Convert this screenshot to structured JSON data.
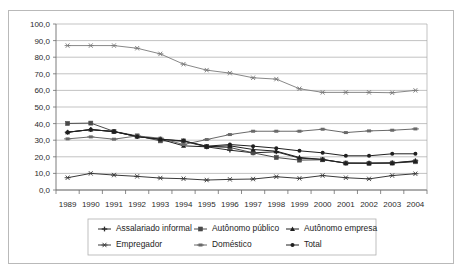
{
  "page": {
    "top_fragment": ""
  },
  "chart_data": {
    "type": "line",
    "title": "",
    "subtitle": "",
    "xlabel": "",
    "ylabel": "",
    "grid": true,
    "legend_position": "bottom",
    "ylim": [
      0,
      100
    ],
    "ytick_labels": [
      "0,0",
      "10,0",
      "20,0",
      "30,0",
      "40,0",
      "50,0",
      "60,0",
      "70,0",
      "80,0",
      "90,0",
      "100,0"
    ],
    "ytick_values": [
      0,
      10,
      20,
      30,
      40,
      50,
      60,
      70,
      80,
      90,
      100
    ],
    "categories": [
      "1989",
      "1990",
      "1991",
      "1992",
      "1993",
      "1994",
      "1995",
      "1996",
      "1997",
      "1998",
      "1999",
      "2000",
      "2001",
      "2002",
      "2003",
      "2004"
    ],
    "series": [
      {
        "name": "Assalariado informal",
        "marker": "cross-plus",
        "color": "#2a2a2a",
        "values": [
          34.8,
          36.4,
          35.2,
          32.2,
          30.6,
          29.4,
          26.0,
          24.0,
          22.4,
          23.0,
          19.2,
          18.4,
          16.2,
          16.2,
          16.3,
          17.6
        ]
      },
      {
        "name": "Autônomo público",
        "marker": "square",
        "color": "#4a4a4a",
        "values": [
          40.1,
          40.3,
          35.3,
          32.6,
          29.6,
          29.6,
          26.2,
          25.6,
          22.4,
          19.6,
          18.0,
          18.2,
          16.2,
          16.0,
          16.2,
          17.0
        ]
      },
      {
        "name": "Autônomo empresa",
        "marker": "triangle",
        "color": "#1f1f1f",
        "values": [
          34.8,
          36.4,
          35.2,
          32.2,
          30.6,
          26.6,
          26.0,
          26.6,
          24.4,
          23.4,
          19.6,
          18.4,
          16.2,
          16.2,
          16.3,
          17.4
        ]
      },
      {
        "name": "Empregador",
        "marker": "star",
        "color": "#3a3a3a",
        "values": [
          7.4,
          10.0,
          9.0,
          8.2,
          7.2,
          6.8,
          6.0,
          6.4,
          6.6,
          8.0,
          7.0,
          8.7,
          7.4,
          6.7,
          8.7,
          9.8
        ]
      },
      {
        "name": "Doméstico",
        "marker": "dash-square",
        "color": "#6a6a6a",
        "values": [
          30.8,
          32.0,
          30.6,
          32.6,
          31.2,
          27.4,
          30.4,
          33.4,
          35.4,
          35.4,
          35.4,
          36.6,
          34.6,
          35.6,
          36.0,
          36.8
        ]
      },
      {
        "name": "Total",
        "marker": "circle",
        "color": "#202020",
        "values": [
          34.8,
          36.4,
          35.2,
          32.2,
          30.6,
          29.6,
          26.4,
          27.4,
          26.4,
          25.2,
          23.6,
          22.4,
          20.6,
          20.6,
          21.8,
          21.8
        ]
      }
    ],
    "top_series_note": {
      "name": "Autônomo público",
      "values": [
        87.0,
        87.0,
        87.0,
        85.4,
        82.0,
        75.8,
        72.2,
        70.4,
        67.6,
        66.8,
        61.0,
        58.8,
        58.8,
        58.8,
        58.6,
        60.0
      ]
    }
  }
}
